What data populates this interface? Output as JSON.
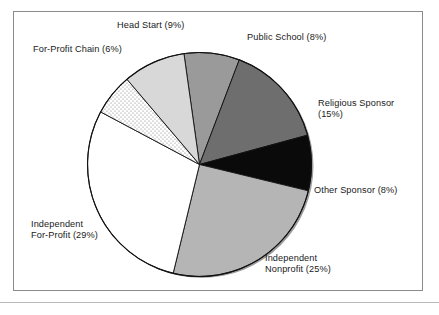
{
  "chart_data": {
    "type": "pie",
    "title": "",
    "subtitle": "",
    "xlabel": "",
    "ylabel": "",
    "legend_position": "none",
    "label_format": "{name} ({value}%)",
    "start_angle_deg": -8,
    "direction": "clockwise",
    "categories": [
      "Public School",
      "Religious Sponsor",
      "Other Sponsor",
      "Independent Nonprofit",
      "Independent For-Profit",
      "For-Profit Chain",
      "Head Start"
    ],
    "values": [
      8,
      15,
      8,
      25,
      29,
      6,
      9
    ],
    "total": 100,
    "slices": [
      {
        "name": "Public School",
        "value": 8,
        "label": "Public School (8%)",
        "color": "#9a9a9a",
        "fill_style": "solid"
      },
      {
        "name": "Religious Sponsor",
        "value": 15,
        "label": "Religious Sponsor\n(15%)",
        "color": "#6e6e6e",
        "fill_style": "solid"
      },
      {
        "name": "Other Sponsor",
        "value": 8,
        "label": "Other Sponsor (8%)",
        "color": "#0a0a0a",
        "fill_style": "solid"
      },
      {
        "name": "Independent Nonprofit",
        "value": 25,
        "label": "Independent\nNonprofit (25%)",
        "color": "#b5b5b5",
        "fill_style": "solid"
      },
      {
        "name": "Independent For-Profit",
        "value": 29,
        "label": "Independent\nFor-Profit (29%)",
        "color": "#ffffff",
        "fill_style": "solid"
      },
      {
        "name": "For-Profit Chain",
        "value": 6,
        "label": "For-Profit Chain (6%)",
        "color": "#fdfdfd",
        "fill_style": "stipple"
      },
      {
        "name": "Head Start",
        "value": 9,
        "label": "Head Start (9%)",
        "color": "#d8d8d8",
        "fill_style": "solid"
      }
    ]
  },
  "figure": {
    "frame_color": "#8b8b8b",
    "rule_color": "#b9b9b9",
    "background": "#ffffff",
    "outline_color": "#111111"
  }
}
